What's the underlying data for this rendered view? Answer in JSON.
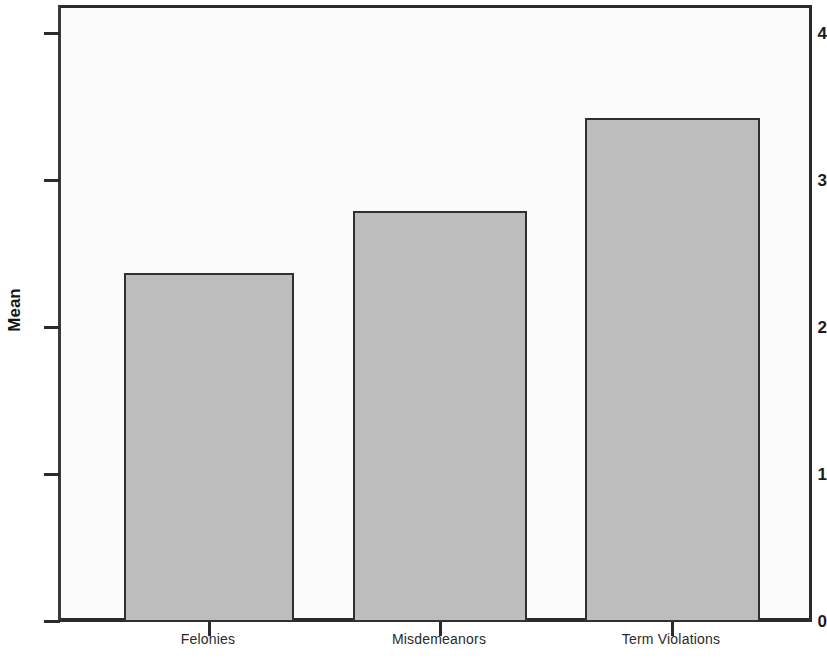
{
  "chart_data": {
    "type": "bar",
    "title": "",
    "subtitle": "",
    "xlabel": "",
    "ylabel": "Mean",
    "categories": [
      "Felonies",
      "Misdemeanors",
      "Term Violations"
    ],
    "values": [
      2.37,
      2.79,
      3.42
    ],
    "series": [
      {
        "name": "Mean",
        "values": [
          2.37,
          2.79,
          3.42
        ]
      }
    ],
    "ylim": [
      0,
      4.2
    ],
    "yticks": [
      0,
      1,
      2,
      3,
      4
    ],
    "ytick_labels": [
      "0",
      "1",
      "2",
      "3",
      "4"
    ],
    "grid": false,
    "legend": false,
    "legend_position": "none",
    "bar_fill_color": "#bdbdbd",
    "bar_border_color": "#303030",
    "axis_color": "#2b2b2b",
    "plot_background": "#fbfbfb",
    "figure_background": "#ffffff"
  },
  "axis": {
    "y_title": "Mean",
    "y_tick_0": "0",
    "y_tick_1": "1",
    "y_tick_2": "2",
    "y_tick_3": "3",
    "y_tick_4": "4",
    "x_label_0": "Felonies",
    "x_label_1": "Misdemeanors",
    "x_label_2": "Term Violations"
  }
}
